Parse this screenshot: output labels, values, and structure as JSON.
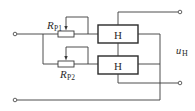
{
  "diagram": {
    "type": "circuit-schematic",
    "resistors": [
      {
        "id": "rp1",
        "label_main": "R",
        "label_sub": "P1"
      },
      {
        "id": "rp2",
        "label_main": "R",
        "label_sub": "P2"
      }
    ],
    "hall_elements": [
      {
        "id": "h1",
        "label": "H"
      },
      {
        "id": "h2",
        "label": "H"
      }
    ],
    "output_voltage": {
      "label_main": "u",
      "label_sub": "H"
    },
    "terminals": [
      "input-top",
      "input-bottom",
      "output-top",
      "output-bottom"
    ],
    "colors": {
      "line": "#3a3a3a",
      "background": "#ffffff"
    }
  }
}
